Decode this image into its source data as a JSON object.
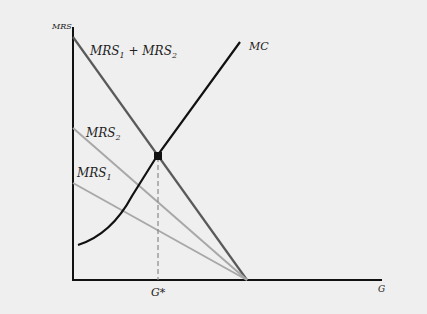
{
  "figure": {
    "y_axis_label": "MRS",
    "x_axis_label": "G",
    "equilibrium_label": "G*",
    "curves": {
      "sum": {
        "label_main": "MRS",
        "label_sub1": "1",
        "label_plus": " + MRS",
        "label_sub2": "2",
        "color": "#5a5a5a"
      },
      "mrs2": {
        "label_main": "MRS",
        "label_sub": "2",
        "color": "#a8a8a8"
      },
      "mrs1": {
        "label_main": "MRS",
        "label_sub": "1",
        "color": "#a8a8a8"
      },
      "mc": {
        "label": "MC",
        "color": "#111111"
      }
    },
    "background": "#efefef"
  }
}
